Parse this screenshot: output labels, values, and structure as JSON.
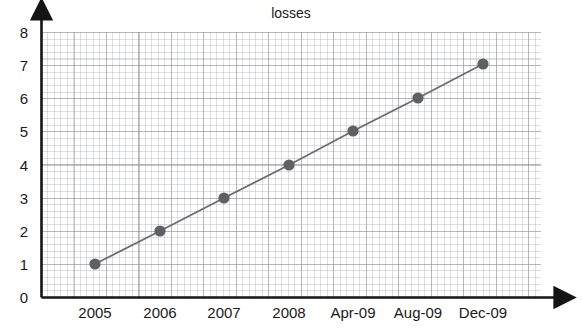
{
  "chart_data": {
    "type": "line",
    "title": "losses",
    "xlabel": "",
    "ylabel": "",
    "categories": [
      "2005",
      "2006",
      "2007",
      "2008",
      "Apr-09",
      "Aug-09",
      "Dec-09"
    ],
    "values": [
      1,
      2,
      3,
      4,
      5,
      6,
      7
    ],
    "series": [
      {
        "name": "losses",
        "values": [
          1,
          2,
          3,
          4,
          5,
          6,
          7
        ]
      }
    ],
    "y_ticks": [
      "0",
      "1",
      "2",
      "3",
      "4",
      "5",
      "6",
      "7",
      "8"
    ],
    "ylim": [
      0,
      8
    ],
    "grid": true,
    "minor_grid": true,
    "legend": "none",
    "colors": {
      "line": "#6b6b70",
      "marker": "#5f5f66",
      "axis": "#141414",
      "major_grid": "#96969b",
      "minor_grid": "#afb2b9",
      "background": "#ffffff",
      "text": "#1a1a1a"
    },
    "points": [
      {
        "label": "2005",
        "value": 1,
        "px": 95,
        "py": 264
      },
      {
        "label": "2006",
        "value": 2,
        "px": 160,
        "py": 231
      },
      {
        "label": "2007",
        "value": 3,
        "px": 224,
        "py": 198
      },
      {
        "label": "2008",
        "value": 4,
        "px": 289,
        "py": 165
      },
      {
        "label": "Apr-09",
        "value": 5,
        "px": 353,
        "py": 131
      },
      {
        "label": "Aug-09",
        "value": 6,
        "px": 418,
        "py": 98
      },
      {
        "label": "Dec-09",
        "value": 7,
        "px": 483,
        "py": 64
      }
    ],
    "y_tick_positions": [
      {
        "label": "8",
        "py": 32
      },
      {
        "label": "7",
        "py": 65
      },
      {
        "label": "6",
        "py": 98
      },
      {
        "label": "5",
        "py": 131
      },
      {
        "label": "4",
        "py": 165
      },
      {
        "label": "3",
        "py": 198
      },
      {
        "label": "2",
        "py": 231
      },
      {
        "label": "1",
        "py": 264
      },
      {
        "label": "0",
        "py": 297
      }
    ]
  }
}
